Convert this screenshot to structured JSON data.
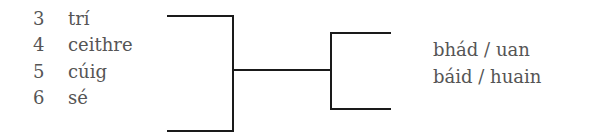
{
  "left_list": {
    "items": [
      {
        "number": "3",
        "word": "trí"
      },
      {
        "number": "4",
        "word": "ceithre"
      },
      {
        "number": "5",
        "word": "cúig"
      },
      {
        "number": "6",
        "word": "sé"
      }
    ]
  },
  "right_list": {
    "items": [
      {
        "text": "bhád / uan"
      },
      {
        "text": "báid / huain"
      }
    ]
  },
  "colors": {
    "text": "#555555",
    "lines": "#1a1a1a",
    "background": "#ffffff"
  }
}
